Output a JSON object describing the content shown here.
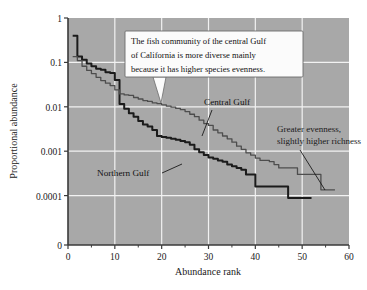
{
  "chart_data": {
    "type": "line",
    "title": "",
    "xlabel": "Abundance rank",
    "ylabel": "Proportional abundance",
    "xlim": [
      0,
      60
    ],
    "ylim": [
      0.0001,
      1
    ],
    "yscale": "log",
    "grid": true,
    "legend_position": "inline-annotations",
    "x_ticks": [
      "0",
      "10",
      "20",
      "30",
      "40",
      "50",
      "60"
    ],
    "x_tick_values": [
      0,
      10,
      20,
      30,
      40,
      50,
      60
    ],
    "x_minor_tick_values": [
      5,
      15,
      25,
      35,
      45,
      55
    ],
    "y_ticks": [
      "1",
      "0.1",
      "0.01",
      "0.001",
      "0.0001",
      "0"
    ],
    "y_tick_values": [
      1,
      0.1,
      0.01,
      0.001,
      0.0001,
      0
    ],
    "series": [
      {
        "name": "Northern Gulf",
        "color": "#1b1b1b",
        "x": [
          1,
          2,
          3,
          4,
          5,
          6,
          7,
          8,
          9,
          10,
          11,
          12,
          13,
          14,
          15,
          16,
          17,
          18,
          19,
          20,
          21,
          22,
          23,
          24,
          25,
          26,
          27,
          28,
          29,
          30,
          31,
          32,
          33,
          34,
          35,
          36,
          37,
          38,
          39,
          40,
          41,
          42,
          43,
          44,
          45,
          46,
          47,
          48,
          49,
          50,
          51,
          52
        ],
        "values": [
          0.4,
          0.135,
          0.115,
          0.095,
          0.082,
          0.072,
          0.068,
          0.06,
          0.058,
          0.04,
          0.0115,
          0.009,
          0.0072,
          0.006,
          0.0048,
          0.004,
          0.0036,
          0.003,
          0.0022,
          0.0021,
          0.002,
          0.0019,
          0.0018,
          0.0017,
          0.0016,
          0.0014,
          0.0011,
          0.00095,
          0.00082,
          0.00072,
          0.00068,
          0.00062,
          0.00058,
          0.0005,
          0.00046,
          0.00042,
          0.00038,
          0.0003,
          0.0003,
          0.00016,
          0.00016,
          0.00016,
          0.00016,
          0.00016,
          0.00016,
          0.00016,
          8.8e-05,
          8.8e-05,
          8.8e-05,
          8.8e-05,
          8.8e-05,
          8.8e-05
        ]
      },
      {
        "name": "Central Gulf",
        "color": "#4d4d4d",
        "x": [
          1,
          2,
          3,
          4,
          5,
          6,
          7,
          8,
          9,
          10,
          11,
          12,
          13,
          14,
          15,
          16,
          17,
          18,
          19,
          20,
          21,
          22,
          23,
          24,
          25,
          26,
          27,
          28,
          29,
          30,
          31,
          32,
          33,
          34,
          35,
          36,
          37,
          38,
          39,
          40,
          41,
          42,
          43,
          44,
          45,
          46,
          47,
          48,
          49,
          50,
          51,
          52,
          53,
          54,
          55,
          56,
          57
        ],
        "values": [
          0.135,
          0.11,
          0.082,
          0.066,
          0.056,
          0.046,
          0.039,
          0.034,
          0.03,
          0.024,
          0.0195,
          0.0185,
          0.018,
          0.0162,
          0.015,
          0.0138,
          0.0132,
          0.0122,
          0.0118,
          0.011,
          0.0104,
          0.0098,
          0.0092,
          0.0086,
          0.0078,
          0.0068,
          0.006,
          0.005,
          0.0042,
          0.0038,
          0.003,
          0.0026,
          0.0022,
          0.0019,
          0.0016,
          0.0013,
          0.0011,
          0.00092,
          0.00082,
          0.0007,
          0.00062,
          0.00062,
          0.00058,
          0.0005,
          0.00042,
          0.00042,
          0.00042,
          0.00042,
          0.0003,
          0.0003,
          0.0003,
          0.0003,
          0.0003,
          0.000135,
          0.000135,
          0.000135,
          0.000135
        ]
      }
    ],
    "annotations": [
      {
        "id": "callout",
        "text_lines": [
          "The fish community of the central Gulf",
          "of California is more diverse mainly",
          "because it has higher species evenness."
        ]
      },
      {
        "id": "central-gulf-label",
        "text": "Central Gulf"
      },
      {
        "id": "northern-gulf-label",
        "text": "Northern Gulf"
      },
      {
        "id": "evenness-note",
        "text_lines": [
          "Greater evenness,",
          "slightly higher richness"
        ]
      }
    ]
  },
  "style": {
    "plot_background": "#a8a8a8",
    "grid_color": "#f2f2f2",
    "axis_color": "#3a3a3a",
    "page_background": "#ffffff",
    "callout_background": "#fbfbfb",
    "callout_border": "#6b6b6b"
  }
}
